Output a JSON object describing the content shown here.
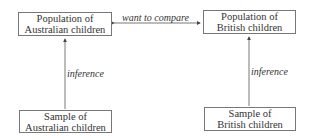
{
  "nodes": {
    "pop_aus": {
      "line1": "Population of",
      "line2": "Australian children"
    },
    "pop_brit": {
      "line1": "Population of",
      "line2": "British children"
    },
    "sample_aus": {
      "line1": "Sample of",
      "line2": "Australian children"
    },
    "sample_brit": {
      "line1": "Sample of",
      "line2": "British children"
    }
  },
  "edges": {
    "compare": "want to compare",
    "inference_left": "inference",
    "inference_right": "inference"
  },
  "colors": {
    "line": "#555555",
    "text": "#333333"
  }
}
